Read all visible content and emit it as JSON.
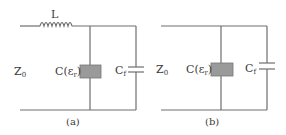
{
  "circuit_a": {
    "inductor_label": "L",
    "impedance_label": "Z",
    "impedance_sub": "0",
    "dielectric_label": "C(ε",
    "dielectric_sub": "r",
    "dielectric_close": ")",
    "fringe_label": "C",
    "fringe_sub": "f",
    "caption": "(a)"
  },
  "circuit_b": {
    "impedance_label": "Z",
    "impedance_sub": "0",
    "dielectric_label": "C(ε",
    "dielectric_sub": "r",
    "dielectric_close": ")",
    "fringe_label": "C",
    "fringe_sub": "f",
    "caption": "(b)"
  },
  "colors": {
    "wire": "#6e6e6e",
    "dielectric_fill": "#9a9a9a",
    "text": "#3a3a3a"
  }
}
